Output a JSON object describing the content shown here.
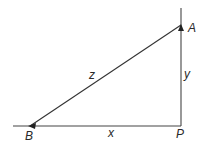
{
  "diagram": {
    "type": "right-triangle",
    "points": {
      "A": {
        "label": "A",
        "x": 181,
        "y": 25
      },
      "B": {
        "label": "B",
        "x": 30,
        "y": 126
      },
      "P": {
        "label": "P",
        "x": 181,
        "y": 126
      }
    },
    "sides": {
      "x": {
        "label": "x",
        "from": "B",
        "to": "P"
      },
      "y": {
        "label": "y",
        "from": "P",
        "to": "A"
      },
      "z": {
        "label": "z",
        "from": "B",
        "to": "A"
      }
    },
    "line_color": "#333333"
  }
}
